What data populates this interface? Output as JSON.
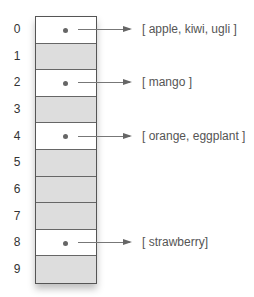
{
  "diagram": {
    "type": "hash-table-buckets",
    "rows": [
      {
        "index": "0",
        "filled": true,
        "contents": "[ apple, kiwi, ugli ]"
      },
      {
        "index": "1",
        "filled": false,
        "contents": null
      },
      {
        "index": "2",
        "filled": true,
        "contents": "[ mango ]"
      },
      {
        "index": "3",
        "filled": false,
        "contents": null
      },
      {
        "index": "4",
        "filled": true,
        "contents": "[ orange, eggplant ]"
      },
      {
        "index": "5",
        "filled": false,
        "contents": null
      },
      {
        "index": "6",
        "filled": false,
        "contents": null
      },
      {
        "index": "7",
        "filled": false,
        "contents": null
      },
      {
        "index": "8",
        "filled": true,
        "contents": "[ strawberry]"
      },
      {
        "index": "9",
        "filled": false,
        "contents": null
      }
    ],
    "colors": {
      "empty_cell": "#dddddd",
      "filled_cell": "#ffffff",
      "border": "#555555",
      "text": "#555555",
      "arrow": "#777777"
    }
  }
}
